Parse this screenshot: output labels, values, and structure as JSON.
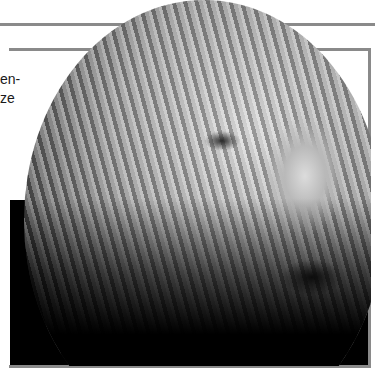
{
  "page": {
    "side_text_lines": [
      "en-",
      "ze"
    ]
  },
  "figure": {
    "image_subject": "satellite-photo-of-earth-with-cloud-swirls",
    "frame_color": "#8a8a8a",
    "background": "#000000"
  }
}
